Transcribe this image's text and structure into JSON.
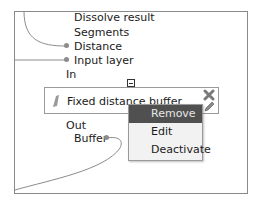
{
  "canvas": {
    "inputs": [
      "Dissolve result",
      "Segments",
      "Distance",
      "Input layer"
    ],
    "in_label": "In",
    "out_label": "Out",
    "outputs": [
      "Buffer"
    ]
  },
  "node": {
    "title": "Fixed distance buffer",
    "icons": [
      "algorithm-icon",
      "remove-x-icon",
      "edit-pencil-icon"
    ]
  },
  "context_menu": {
    "items": [
      {
        "label": "Remove",
        "highlighted": true
      },
      {
        "label": "Edit",
        "highlighted": false
      },
      {
        "label": "Deactivate",
        "highlighted": false
      }
    ]
  },
  "colors": {
    "menu_highlight": "#505050",
    "menu_bg": "#f2f2f2",
    "wire": "#8c8c8c"
  }
}
